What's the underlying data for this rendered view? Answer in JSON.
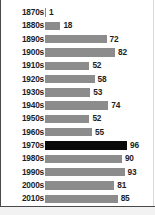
{
  "chart_data": {
    "type": "bar",
    "orientation": "horizontal",
    "title": "",
    "subtitle": "",
    "xlabel": "",
    "ylabel": "",
    "grid": false,
    "legend": null,
    "xlim": [
      0,
      100
    ],
    "categories": [
      "1870s",
      "1880s",
      "1890s",
      "1900s",
      "1910s",
      "1920s",
      "1930s",
      "1940s",
      "1950s",
      "1960s",
      "1970s",
      "1980s",
      "1990s",
      "2000s",
      "2010s",
      "2020s"
    ],
    "values": [
      1,
      18,
      72,
      82,
      52,
      58,
      53,
      74,
      52,
      55,
      96,
      90,
      93,
      81,
      85,
      38
    ],
    "value_labels": [
      "1",
      "18",
      "72",
      "82",
      "52",
      "58",
      "53",
      "74",
      "52",
      "55",
      "96",
      "90",
      "93",
      "81",
      "85",
      "38"
    ],
    "highlight_category": "1970s",
    "highlight_value": 96,
    "bars": [
      {
        "category": "1870s",
        "value": 1,
        "label": "1",
        "highlighted": false
      },
      {
        "category": "1880s",
        "value": 18,
        "label": "18",
        "highlighted": false
      },
      {
        "category": "1890s",
        "value": 72,
        "label": "72",
        "highlighted": false
      },
      {
        "category": "1900s",
        "value": 82,
        "label": "82",
        "highlighted": false
      },
      {
        "category": "1910s",
        "value": 52,
        "label": "52",
        "highlighted": false
      },
      {
        "category": "1920s",
        "value": 58,
        "label": "58",
        "highlighted": false
      },
      {
        "category": "1930s",
        "value": 53,
        "label": "53",
        "highlighted": false
      },
      {
        "category": "1940s",
        "value": 74,
        "label": "74",
        "highlighted": false
      },
      {
        "category": "1950s",
        "value": 52,
        "label": "52",
        "highlighted": false
      },
      {
        "category": "1960s",
        "value": 55,
        "label": "55",
        "highlighted": false
      },
      {
        "category": "1970s",
        "value": 96,
        "label": "96",
        "highlighted": true
      },
      {
        "category": "1980s",
        "value": 90,
        "label": "90",
        "highlighted": false
      },
      {
        "category": "1990s",
        "value": 93,
        "label": "93",
        "highlighted": false
      },
      {
        "category": "2000s",
        "value": 81,
        "label": "81",
        "highlighted": false
      },
      {
        "category": "2010s",
        "value": 85,
        "label": "85",
        "highlighted": false
      },
      {
        "category": "2020s",
        "value": 38,
        "label": "38",
        "highlighted": false
      }
    ]
  },
  "style": {
    "bar_color": "#8c8c8c",
    "highlight_color": "#0a0a0a",
    "text_color": "#1d1d1d",
    "background": "#ffffff",
    "rule_color": "#4a4a4a",
    "footer_color": "#f2f2f2"
  }
}
